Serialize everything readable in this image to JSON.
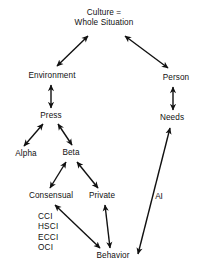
{
  "diagram": {
    "title_node": {
      "id": "culture",
      "label": "Culture =\nWhole Situation",
      "x": 104,
      "y": 18
    },
    "nodes": [
      {
        "id": "environment",
        "label": "Environment",
        "x": 52,
        "y": 76
      },
      {
        "id": "person",
        "label": "Person",
        "x": 176,
        "y": 78
      },
      {
        "id": "press",
        "label": "Press",
        "x": 51,
        "y": 116
      },
      {
        "id": "needs",
        "label": "Needs",
        "x": 172,
        "y": 118
      },
      {
        "id": "alpha",
        "label": "Alpha",
        "x": 26,
        "y": 154
      },
      {
        "id": "beta",
        "label": "Beta",
        "x": 71,
        "y": 153
      },
      {
        "id": "consensual",
        "label": "Consensual",
        "x": 51,
        "y": 196
      },
      {
        "id": "private",
        "label": "Private",
        "x": 102,
        "y": 196
      },
      {
        "id": "behavior",
        "label": "Behavior",
        "x": 113,
        "y": 256
      }
    ],
    "edge_labels": [
      {
        "id": "ai",
        "label": "AI",
        "x": 159,
        "y": 196
      }
    ],
    "acronyms": {
      "id": "instrument-list",
      "label": "CCI\nHSCI\nECCI\nOCI",
      "x": 38,
      "y": 212
    },
    "edges": [
      {
        "id": "culture-environment",
        "from": "culture",
        "to": "environment",
        "x1": 88,
        "y1": 36,
        "x2": 57,
        "y2": 66,
        "heads": "both"
      },
      {
        "id": "culture-person",
        "from": "culture",
        "to": "person",
        "x1": 125,
        "y1": 36,
        "x2": 168,
        "y2": 68,
        "heads": "both"
      },
      {
        "id": "environment-press",
        "from": "environment",
        "to": "press",
        "x1": 51,
        "y1": 85,
        "x2": 51,
        "y2": 108,
        "heads": "both"
      },
      {
        "id": "person-needs",
        "from": "person",
        "to": "needs",
        "x1": 173,
        "y1": 87,
        "x2": 173,
        "y2": 110,
        "heads": "both"
      },
      {
        "id": "press-alpha",
        "from": "press",
        "to": "alpha",
        "x1": 43,
        "y1": 124,
        "x2": 24,
        "y2": 146,
        "heads": "both"
      },
      {
        "id": "press-beta",
        "from": "press",
        "to": "beta",
        "x1": 58,
        "y1": 124,
        "x2": 72,
        "y2": 145,
        "heads": "both"
      },
      {
        "id": "beta-consensual",
        "from": "beta",
        "to": "consensual",
        "x1": 66,
        "y1": 162,
        "x2": 50,
        "y2": 188,
        "heads": "both"
      },
      {
        "id": "beta-private",
        "from": "beta",
        "to": "private",
        "x1": 77,
        "y1": 162,
        "x2": 98,
        "y2": 188,
        "heads": "both"
      },
      {
        "id": "consensual-behavior",
        "from": "consensual",
        "to": "behavior",
        "x1": 55,
        "y1": 205,
        "x2": 100,
        "y2": 248,
        "heads": "both"
      },
      {
        "id": "private-behavior",
        "from": "private",
        "to": "behavior",
        "x1": 105,
        "y1": 205,
        "x2": 110,
        "y2": 248,
        "heads": "both"
      },
      {
        "id": "behavior-needs",
        "from": "behavior",
        "to": "needs",
        "x1": 138,
        "y1": 254,
        "x2": 170,
        "y2": 128,
        "heads": "both"
      }
    ],
    "style": {
      "background": "#ffffff",
      "ink": "#111111",
      "stroke_width": 1.4
    }
  }
}
